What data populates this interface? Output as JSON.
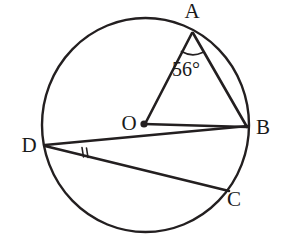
{
  "figure": {
    "kind": "circle-geometry-diagram",
    "stroke_color": "#231f20",
    "background_color": "#ffffff",
    "circle": {
      "center_x": 145.5,
      "center_y": 125,
      "radius_x": 103.5,
      "radius_y": 107,
      "stroke_width": 2.4
    },
    "center_dot": {
      "x": 144,
      "y": 124,
      "radius": 3.6
    },
    "points": [
      {
        "id": "A",
        "label": "A",
        "x": 192,
        "y": 32,
        "label_x": 192,
        "label_y": 18
      },
      {
        "id": "B",
        "label": "B",
        "x": 247,
        "y": 127,
        "label_x": 263,
        "label_y": 134
      },
      {
        "id": "C",
        "label": "C",
        "x": 228,
        "y": 190,
        "label_x": 234,
        "label_y": 206
      },
      {
        "id": "D",
        "label": "D",
        "x": 45,
        "y": 145,
        "label_x": 29,
        "label_y": 152
      },
      {
        "id": "O",
        "label": "O",
        "x": 144,
        "y": 124,
        "label_x": 129,
        "label_y": 130
      }
    ],
    "segments": [
      {
        "id": "AO",
        "from": "A",
        "to": "O",
        "x1": 192,
        "y1": 33,
        "x2": 145,
        "y2": 124
      },
      {
        "id": "AB",
        "from": "A",
        "to": "B",
        "x1": 193,
        "y1": 33,
        "x2": 247,
        "y2": 127
      },
      {
        "id": "OB",
        "from": "O",
        "to": "B",
        "x1": 144,
        "y1": 124,
        "x2": 247,
        "y2": 127
      },
      {
        "id": "DB",
        "from": "D",
        "to": "B",
        "x1": 45,
        "y1": 145,
        "x2": 248,
        "y2": 126
      },
      {
        "id": "DC",
        "from": "D",
        "to": "C",
        "x1": 45,
        "y1": 146,
        "x2": 229,
        "y2": 191
      }
    ],
    "angle_marks": [
      {
        "id": "angle-at-A",
        "at_point": "A",
        "type": "arc",
        "value": "56°",
        "label": "56°",
        "label_x": 186,
        "label_y": 76,
        "arc_path": "M 181.5 51.5 Q 192 57 202.5 52.5"
      },
      {
        "id": "angle-at-D",
        "at_point": "D",
        "type": "double-tick",
        "value": "",
        "tick1": {
          "x1": 82,
          "y1": 147.5,
          "x2": 83.5,
          "y2": 157
        },
        "tick2": {
          "x1": 86.5,
          "y1": 148,
          "x2": 88,
          "y2": 157.5
        }
      }
    ]
  }
}
